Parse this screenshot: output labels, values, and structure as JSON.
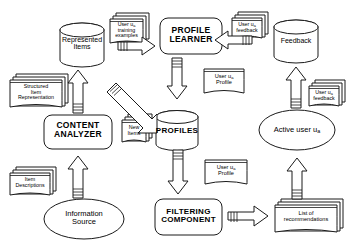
{
  "diagram": {
    "stroke_color": "#1a1a1a",
    "fill_color": "#ffffff",
    "nodes": {
      "represented_items": {
        "label_line1": "Represented",
        "label_line2": "Items",
        "shape": "cylinder"
      },
      "profile_learner": {
        "label_line1": "PROFILE",
        "label_line2": "LEARNER",
        "shape": "rounded-rect"
      },
      "feedback_store": {
        "label_line1": "Feedback",
        "shape": "cylinder"
      },
      "content_analyzer": {
        "label_line1": "CONTENT",
        "label_line2": "ANALYZER",
        "shape": "rounded-rect"
      },
      "profiles_store": {
        "label_line1": "PROFILES",
        "shape": "cylinder"
      },
      "active_user": {
        "label_line1": "Active user u",
        "subscript": "a",
        "shape": "ellipse"
      },
      "information_source": {
        "label_line1": "Information",
        "label_line2": "Source",
        "shape": "ellipse"
      },
      "filtering_component": {
        "label_line1": "FILTERING",
        "label_line2": "COMPONENT",
        "shape": "rounded-rect"
      },
      "training_examples_doc": {
        "label_line1": "User u",
        "subscript": "a",
        "label_line2": "training",
        "label_line3": "examples",
        "shape": "document-stack"
      },
      "user_feedback_doc_top": {
        "label_line1": "User u",
        "subscript": "a",
        "label_line2": "feedback",
        "shape": "document-stack"
      },
      "user_feedback_doc_right": {
        "label_line1": "User u",
        "subscript": "a",
        "label_line2": "feedback",
        "shape": "document-stack"
      },
      "structured_item_rep_doc": {
        "label_line1": "Structured",
        "label_line2": "Item",
        "label_line3": "Representation",
        "shape": "document-stack"
      },
      "new_items_doc": {
        "label_line1": "New",
        "label_line2": "Items",
        "shape": "document-stack"
      },
      "item_descriptions_doc": {
        "label_line1": "Item",
        "label_line2": "Descriptions",
        "shape": "document-stack"
      },
      "user_profile_doc_upper": {
        "label_line1": "User u",
        "subscript": "a",
        "label_line2": "Profile",
        "shape": "document"
      },
      "user_profile_doc_lower": {
        "label_line1": "User u",
        "subscript": "a",
        "label_line2": "Profile",
        "shape": "document"
      },
      "recommendations_doc": {
        "label_line1": "List of",
        "label_line2": "recommendations",
        "shape": "document-stack"
      }
    },
    "flows": [
      {
        "name": "training-examples-to-profile-learner",
        "type": "block-arrow",
        "direction": "right"
      },
      {
        "name": "feedback-to-profile-learner",
        "type": "block-arrow",
        "direction": "left"
      },
      {
        "name": "profile-learner-to-profiles",
        "type": "block-arrow",
        "direction": "down"
      },
      {
        "name": "structured-rep-to-represented-items",
        "type": "block-arrow",
        "direction": "up"
      },
      {
        "name": "content-analyzer-to-represented-items",
        "type": "block-arrow",
        "direction": "up"
      },
      {
        "name": "represented-items-to-filtering",
        "type": "block-arrow",
        "direction": "down-right"
      },
      {
        "name": "information-source-to-content-analyzer",
        "type": "block-arrow",
        "direction": "up"
      },
      {
        "name": "profiles-to-filtering",
        "type": "block-arrow",
        "direction": "down"
      },
      {
        "name": "filtering-to-recommendations",
        "type": "block-arrow",
        "direction": "right"
      },
      {
        "name": "recommendations-to-active-user",
        "type": "block-arrow",
        "direction": "up"
      },
      {
        "name": "active-user-to-feedback",
        "type": "block-arrow",
        "direction": "up"
      }
    ]
  }
}
